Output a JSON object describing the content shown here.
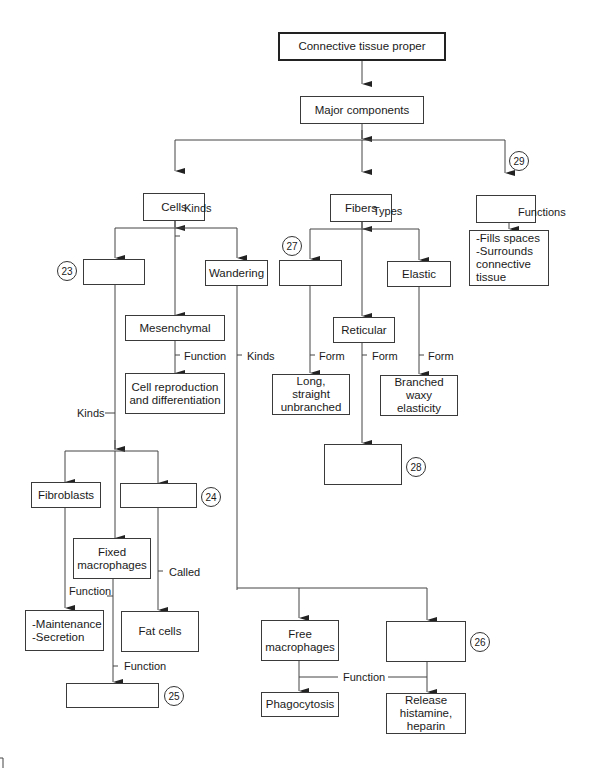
{
  "diagram": {
    "title": "Connective tissue proper",
    "nodes": {
      "root": "Connective tissue proper",
      "major": "Major components",
      "cells": "Cells",
      "fibers": "Fibers",
      "ground": "",
      "ground_functions": "-Fills spaces\n-Surrounds\n connective\n tissue",
      "fixed_cells": "",
      "wandering": "Wandering",
      "mesenchymal": "Mesenchymal",
      "mesenchymal_function": "Cell reproduction\nand differentiation",
      "collagenous": "",
      "reticular": "Reticular",
      "elastic": "Elastic",
      "collagen_form": "Long,\nstraight\nunbranched",
      "reticular_form": "",
      "elastic_form": "Branched\nwaxy\nelasticity",
      "fibroblasts": "Fibroblasts",
      "adipose": "",
      "fixed_macrophages": "Fixed\nmacrophages",
      "fibroblast_function": "-Maintenance\n-Secretion",
      "fat_cells": "Fat cells",
      "macrophage_function": "",
      "free_macrophages": "Free\nmacrophages",
      "mast_cells": "",
      "phagocytosis": "Phagocytosis",
      "mast_function": "Release\nhistamine,\nheparin"
    },
    "edge_labels": {
      "cells_kinds": "Kinds",
      "fibers_types": "Types",
      "ground_functions": "Functions",
      "mesenchymal_function": "Function",
      "wandering_kinds": "Kinds",
      "fixed_kinds": "Kinds",
      "collagen_form": "Form",
      "reticular_form": "Form",
      "elastic_form": "Form",
      "adipose_called": "Called",
      "fibroblast_function": "Function",
      "macrophage_function": "Function",
      "free_function": "Function"
    },
    "blank_numbers": {
      "n23": "23",
      "n24": "24",
      "n25": "25",
      "n26": "26",
      "n27": "27",
      "n28": "28",
      "n29": "29"
    }
  }
}
